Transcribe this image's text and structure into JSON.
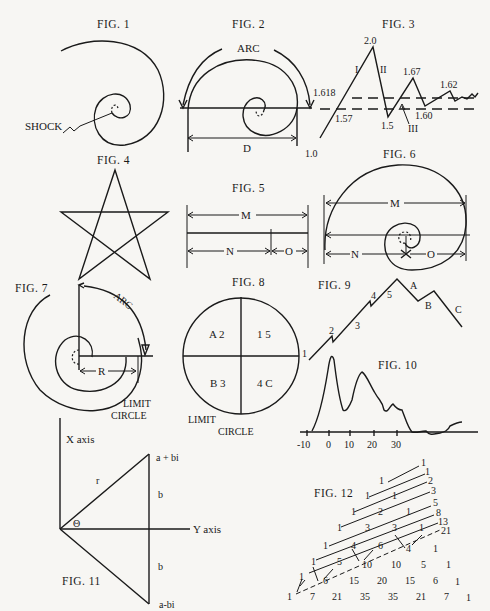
{
  "figures": {
    "fig1": {
      "caption": "FIG. 1",
      "labels": {
        "shock": "SHOCK"
      }
    },
    "fig2": {
      "caption": "FIG. 2",
      "labels": {
        "arc": "ARC",
        "d": "D"
      }
    },
    "fig3": {
      "caption": "FIG. 3",
      "labels": {
        "v1_0": "1.0",
        "v1_618": "1.618",
        "v1_57": "1.57",
        "v2_0": "2.0",
        "wave_i": "I",
        "wave_ii": "II",
        "v1_5": "1.5",
        "v1_67": "1.67",
        "v1_60": "1.60",
        "wave_iii": "III",
        "v1_62": "1.62"
      }
    },
    "fig4": {
      "caption": "FIG. 4"
    },
    "fig5": {
      "caption": "FIG. 5",
      "labels": {
        "m": "M",
        "n": "N",
        "o": "O"
      }
    },
    "fig6": {
      "caption": "FIG. 6",
      "labels": {
        "m": "M",
        "n": "N",
        "o": "O"
      }
    },
    "fig7": {
      "caption": "FIG. 7",
      "labels": {
        "arc": "ARC",
        "r": "R",
        "limit": "LIMIT",
        "circle": "CIRCLE"
      }
    },
    "fig8": {
      "caption": "FIG. 8",
      "labels": {
        "q_a2": "A 2",
        "q_15": "1 5",
        "q_b3": "B 3",
        "q_4c": "4 C",
        "limit": "LIMIT",
        "circle": "CIRCLE"
      }
    },
    "fig9": {
      "caption": "FIG. 9",
      "labels": {
        "w1": "1",
        "w2": "2",
        "w3": "3",
        "w4": "4",
        "w5": "5",
        "wa": "A",
        "wb": "B",
        "wc": "C"
      }
    },
    "fig10": {
      "caption": "FIG. 10",
      "ticks": [
        "-10",
        "0",
        "10",
        "20",
        "30"
      ]
    },
    "fig11": {
      "caption": "FIG. 11",
      "labels": {
        "x_axis": "X axis",
        "y_axis": "Y axis",
        "a_plus_bi": "a + bi",
        "a_minus_bi": "a-bi",
        "r": "r",
        "b_top": "b",
        "b_bottom": "b",
        "theta": "Θ"
      }
    },
    "fig12": {
      "caption": "FIG. 12",
      "fibonacci": [
        "1",
        "1",
        "2",
        "3",
        "5",
        "8",
        "13",
        "21"
      ],
      "rows": [
        [
          "1"
        ],
        [
          "1",
          "1"
        ],
        [
          "1",
          "2",
          "1"
        ],
        [
          "1",
          "3",
          "3",
          "1"
        ],
        [
          "1",
          "4",
          "6",
          "4",
          "1"
        ],
        [
          "1",
          "5",
          "10",
          "10",
          "5",
          "1"
        ],
        [
          "1",
          "6",
          "15",
          "20",
          "15",
          "6",
          "1"
        ],
        [
          "1",
          "7",
          "21",
          "35",
          "35",
          "21",
          "7",
          "1"
        ]
      ]
    }
  }
}
